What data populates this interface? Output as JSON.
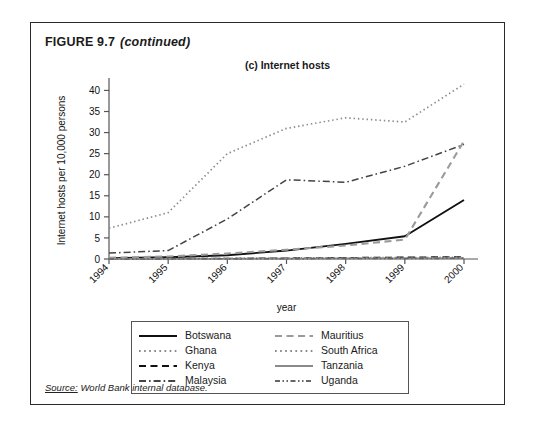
{
  "figure": {
    "caption_main": "FIGURE 9.7",
    "caption_continued": "(continued)",
    "source_prefix": "Source:",
    "source_text": " World Bank internal database."
  },
  "chart_data": {
    "type": "line",
    "title": "(c) Internet hosts",
    "xlabel": "year",
    "ylabel": "Internet hosts per 10,000 persons",
    "x": [
      1994,
      1995,
      1996,
      1997,
      1998,
      1999,
      2000
    ],
    "xtick_labels": [
      "1994",
      "1995",
      "1996",
      "1997",
      "1998",
      "1999",
      "2000"
    ],
    "ytick_labels": [
      "0",
      "5",
      "10",
      "15",
      "20",
      "25",
      "30",
      "35",
      "40"
    ],
    "ytick_values": [
      0,
      5,
      10,
      15,
      20,
      25,
      30,
      35,
      40
    ],
    "ylim": [
      0,
      42
    ],
    "xlim": [
      1994,
      2000
    ],
    "grid": false,
    "legend_position": "below-center",
    "series": [
      {
        "name": "Botswana",
        "values": [
          0.2,
          0.4,
          0.9,
          2.0,
          3.6,
          5.4,
          14.0
        ],
        "style": "solid",
        "color": "#111111",
        "width": 1.9
      },
      {
        "name": "Ghana",
        "values": [
          7.3,
          11.0,
          25.0,
          31.0,
          33.5,
          32.5,
          41.5
        ],
        "style": "dotted",
        "color": "#8a8a8a",
        "width": 1.7
      },
      {
        "name": "Kenya",
        "values": [
          0.05,
          0.08,
          0.12,
          0.2,
          0.3,
          0.4,
          0.5
        ],
        "style": "dashed",
        "color": "#111111",
        "width": 1.5
      },
      {
        "name": "Malaysia",
        "values": [
          1.4,
          2.0,
          9.5,
          18.8,
          18.2,
          22.0,
          27.2
        ],
        "style": "dashdot",
        "color": "#444444",
        "width": 1.5
      },
      {
        "name": "Mauritius",
        "values": [
          0.3,
          0.6,
          1.3,
          2.2,
          3.2,
          4.6,
          28.0
        ],
        "style": "dashed",
        "color": "#9a9a9a",
        "width": 2.1
      },
      {
        "name": "South Africa",
        "values": [
          0.1,
          0.15,
          0.2,
          0.25,
          0.3,
          0.35,
          0.4
        ],
        "style": "dotted",
        "color": "#8a8a8a",
        "width": 1.6
      },
      {
        "name": "Tanzania",
        "values": [
          0.02,
          0.04,
          0.06,
          0.1,
          0.14,
          0.18,
          0.22
        ],
        "style": "solid",
        "color": "#8a8a8a",
        "width": 1.7
      },
      {
        "name": "Uganda",
        "values": [
          0.02,
          0.03,
          0.05,
          0.08,
          0.1,
          0.13,
          0.16
        ],
        "style": "dashdotdot",
        "color": "#666666",
        "width": 1.5
      }
    ]
  },
  "legend": {
    "entries": [
      {
        "label": "Botswana",
        "style": "solid",
        "color": "#111111",
        "width": 2.0
      },
      {
        "label": "Mauritius",
        "style": "dashed",
        "color": "#9a9a9a",
        "width": 2.2
      },
      {
        "label": "Ghana",
        "style": "dotted",
        "color": "#8a8a8a",
        "width": 2.0
      },
      {
        "label": "South Africa",
        "style": "dotted",
        "color": "#8a8a8a",
        "width": 2.0
      },
      {
        "label": "Kenya",
        "style": "dashed",
        "color": "#111111",
        "width": 2.0
      },
      {
        "label": "Tanzania",
        "style": "solid",
        "color": "#8a8a8a",
        "width": 2.0
      },
      {
        "label": "Malaysia",
        "style": "dashdot",
        "color": "#444444",
        "width": 1.8
      },
      {
        "label": "Uganda",
        "style": "dashdotdot",
        "color": "#666666",
        "width": 1.8
      }
    ]
  }
}
